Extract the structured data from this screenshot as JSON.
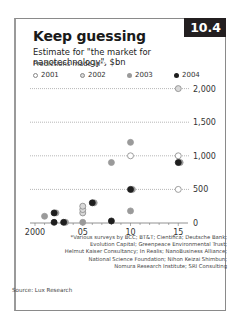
{
  "badge": "10.4",
  "title": "Keep guessing",
  "subtitle": "Estimate for \"the market for nanotechnology\", $bn",
  "predictions_label": "Predictions made in*:",
  "legend": [
    {
      "label": "2001",
      "fill": "#ffffff",
      "stroke": "#888888"
    },
    {
      "label": "2002",
      "fill": "#d9d9d9",
      "stroke": "#888888"
    },
    {
      "label": "2003",
      "fill": "#9a9a9a",
      "stroke": "#9a9a9a"
    },
    {
      "label": "2004",
      "fill": "#1e1e1e",
      "stroke": "#1e1e1e"
    }
  ],
  "footnote": [
    "*Various surveys by BCC; BT&T; Cientifica; Deutsche Bank;",
    "Evolution Capital; Greenpeace Environmental Trust;",
    "Helmut Kaiser Consultancy; In Realis; NanoBusiness Alliance;",
    "National Science Foundation; Nihon Keizai Shimbun;",
    "Nomura Research Institute; SRI Consulting"
  ],
  "source": "Source: Lux Research",
  "chart_data": {
    "type": "scatter",
    "title": "Keep guessing",
    "subtitle": "Estimate for \"the market for nanotechnology\", $bn",
    "xlabel": "",
    "ylabel": "$bn",
    "xlim": [
      1999.5,
      2016
    ],
    "ylim": [
      0,
      2000
    ],
    "x_ticks": [
      "2000",
      "05",
      "10",
      "15"
    ],
    "y_ticks": [
      "0",
      "500",
      "1,000",
      "1,500",
      "2,000"
    ],
    "grid": "horizontal dotted",
    "legend_position": "top",
    "legend_title": "Predictions made in*:",
    "series": [
      {
        "name": "2001",
        "points": [
          {
            "x": 2010,
            "y": 1000
          },
          {
            "x": 2015,
            "y": 1000
          },
          {
            "x": 2015,
            "y": 500
          }
        ]
      },
      {
        "name": "2002",
        "points": [
          {
            "x": 2005,
            "y": 150
          },
          {
            "x": 2005,
            "y": 200
          },
          {
            "x": 2005,
            "y": 250
          },
          {
            "x": 2015,
            "y": 2000
          }
        ]
      },
      {
        "name": "2003",
        "points": [
          {
            "x": 2001,
            "y": 100
          },
          {
            "x": 2002.2,
            "y": 150
          },
          {
            "x": 2003.2,
            "y": 10
          },
          {
            "x": 2005,
            "y": 10
          },
          {
            "x": 2006.2,
            "y": 300
          },
          {
            "x": 2008,
            "y": 900
          },
          {
            "x": 2010,
            "y": 1200
          },
          {
            "x": 2010.2,
            "y": 500
          },
          {
            "x": 2010,
            "y": 180
          },
          {
            "x": 2015.2,
            "y": 900
          }
        ]
      },
      {
        "name": "2004",
        "points": [
          {
            "x": 2002,
            "y": 150
          },
          {
            "x": 2002,
            "y": 10
          },
          {
            "x": 2003,
            "y": 10
          },
          {
            "x": 2006,
            "y": 300
          },
          {
            "x": 2008,
            "y": 30
          },
          {
            "x": 2010,
            "y": 500
          },
          {
            "x": 2015,
            "y": 900
          }
        ]
      }
    ]
  }
}
